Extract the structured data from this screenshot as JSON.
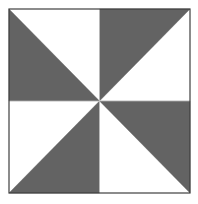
{
  "figure": {
    "type": "geometric-pattern",
    "canvas": {
      "width": 198,
      "height": 204,
      "background_color": "#ffffff"
    },
    "square": {
      "x": 9,
      "y": 9,
      "width": 181,
      "height": 184,
      "center_x": 99.5,
      "center_y": 101,
      "border_color": "#3f3f3f",
      "border_width": 1.2,
      "fill_color": "#ffffff"
    },
    "colors": {
      "shaded": "#636363",
      "unshaded": "#ffffff",
      "outline": "#3f3f3f",
      "divider": "#d8d8d8"
    },
    "symmetry": {
      "order": 4,
      "kind": "rotational",
      "angle_degrees": 90
    },
    "shaded_count": 4,
    "unshaded_count": 4,
    "quadrants": [
      {
        "name": "top-left",
        "shaded_half": "lower-left",
        "diagonal": "top-left-to-bottom-right",
        "points": "9,9 9,101 99.5,101",
        "label": "Q1"
      },
      {
        "name": "top-right",
        "shaded_half": "upper-left",
        "diagonal": "bottom-left-to-top-right",
        "points": "99.5,9 190,9 99.5,101",
        "label": "Q2"
      },
      {
        "name": "bottom-left",
        "shaded_half": "lower-right",
        "diagonal": "bottom-left-to-top-right",
        "points": "99.5,101 9,193 99.5,193",
        "label": "Q3"
      },
      {
        "name": "bottom-right",
        "shaded_half": "upper-right",
        "diagonal": "top-left-to-bottom-right",
        "points": "99.5,101 190,101 190,193",
        "label": "Q4"
      }
    ],
    "dividers": [
      {
        "name": "vertical-midline",
        "x1": 99.5,
        "y1": 9,
        "x2": 99.5,
        "y2": 193
      },
      {
        "name": "horizontal-midline",
        "x1": 9,
        "y1": 101,
        "x2": 190,
        "y2": 101
      }
    ]
  }
}
